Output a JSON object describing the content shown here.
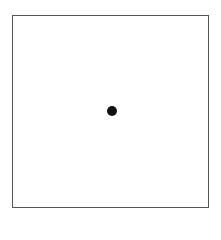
{
  "diagram": {
    "frame": {
      "shape": "square",
      "stroke_color": "#555555",
      "fill": "#ffffff"
    },
    "points": [
      {
        "shape": "filled-circle",
        "color": "#111111",
        "position": "center"
      }
    ]
  }
}
